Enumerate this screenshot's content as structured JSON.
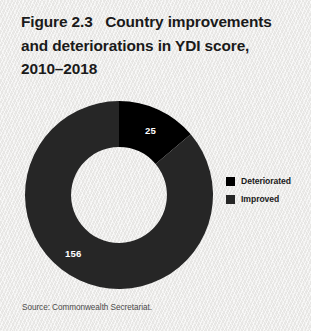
{
  "figure": {
    "title_lines": [
      "Figure 2.3   Country improvements",
      "and deteriorations in YDI score,",
      "2010–2018"
    ],
    "source_note": "Source: Commonwealth Secretariat."
  },
  "legend": {
    "items": [
      {
        "label": "Deteriorated",
        "color": "#000000"
      },
      {
        "label": "Improved",
        "color": "#262626"
      }
    ]
  },
  "chart_data": {
    "type": "pie",
    "variant": "donut",
    "title": "Figure 2.3   Country improvements and deteriorations in YDI score, 2010–2018",
    "categories": [
      "Deteriorated",
      "Improved"
    ],
    "values": [
      25,
      156
    ],
    "total": 181,
    "data_labels": [
      "25",
      "156"
    ],
    "colors": [
      "#000000",
      "#262626"
    ],
    "start_angle_deg": 0,
    "direction": "clockwise",
    "hole_fraction": 0.51,
    "legend_position": "right",
    "grid": false,
    "xlabel": "",
    "ylabel": "",
    "source": "Source: Commonwealth Secretariat."
  }
}
